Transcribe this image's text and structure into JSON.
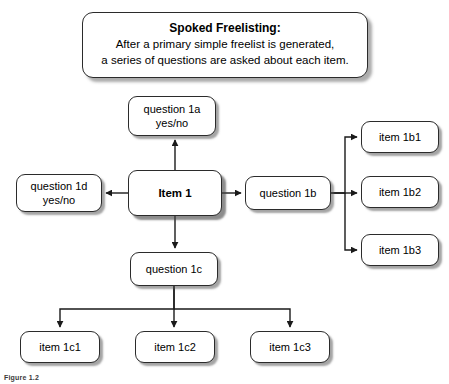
{
  "header": {
    "title": "Spoked Freelisting:",
    "body": "After a primary simple freelist is generated,\na series of questions are asked about each item."
  },
  "nodes": {
    "question_1a": "question 1a\nyes/no",
    "item_1": "Item 1",
    "question_1d": "question 1d\nyes/no",
    "question_1b": "question 1b",
    "question_1c": "question 1c",
    "item_1b1": "item 1b1",
    "item_1b2": "item 1b2",
    "item_1b3": "item 1b3",
    "item_1c1": "item 1c1",
    "item_1c2": "item 1c2",
    "item_1c3": "item 1c3"
  },
  "caption": "Figure 1.2",
  "colors": {
    "background": "#ffffff",
    "box_fill": "#ffffff",
    "box_border": "#2b2b2b",
    "text": "#000000",
    "shadow": "rgba(90,90,90,0.55)",
    "connector": "#1a1a1a"
  }
}
